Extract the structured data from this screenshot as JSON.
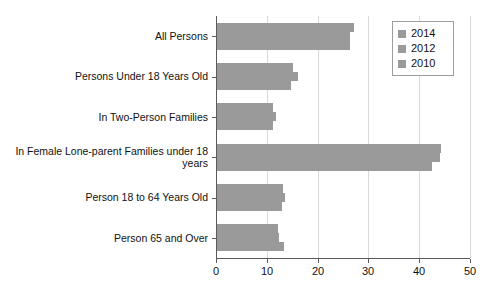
{
  "chart_data": {
    "type": "bar",
    "orientation": "horizontal",
    "title": "",
    "xlabel": "",
    "ylabel": "",
    "xlim": [
      0,
      50
    ],
    "xticks": [
      0,
      10,
      20,
      30,
      40,
      50
    ],
    "grid": true,
    "legend_position": "top-right",
    "categories": [
      "All Persons",
      "Persons Under 18 Years Old",
      "In Two-Person Families",
      "In Female Lone-parent Families under 18 years",
      "Person 18 to 64 Years Old",
      "Person 65 and Over"
    ],
    "series": [
      {
        "name": "2014",
        "color": "#9a9a9a",
        "values": [
          27.0,
          15.0,
          11.0,
          44.0,
          13.0,
          12.0
        ]
      },
      {
        "name": "2012",
        "color": "#9a9a9a",
        "values": [
          26.2,
          15.9,
          11.6,
          43.9,
          13.4,
          12.3
        ]
      },
      {
        "name": "2010",
        "color": "#9a9a9a",
        "values": [
          26.2,
          14.5,
          11.0,
          42.3,
          12.8,
          13.2
        ]
      }
    ]
  },
  "legend": {
    "entries": [
      {
        "label": "2014"
      },
      {
        "label": "2012"
      },
      {
        "label": "2010"
      }
    ]
  },
  "axis": {
    "tick_labels": [
      "0",
      "10",
      "20",
      "30",
      "40",
      "50"
    ]
  }
}
